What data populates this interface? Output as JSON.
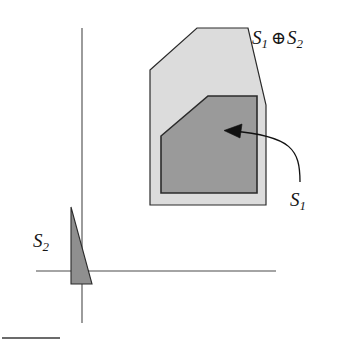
{
  "figure": {
    "caption_free": true,
    "background_color": "#ffffff",
    "labels": {
      "minkowski_sum": {
        "base": "S",
        "sub": "1",
        "operator": "⊕",
        "base2": "S",
        "sub2": "2",
        "full_text": "S1 ⊕ S2"
      },
      "set_s1": {
        "base": "S",
        "sub": "1",
        "full_text": "S1"
      },
      "set_s2": {
        "base": "S",
        "sub": "2",
        "full_text": "S2"
      }
    },
    "colors": {
      "outer_fill": "#dcdcdc",
      "outer_stroke": "#2b2b2b",
      "inner_fill": "#9a9a9a",
      "inner_stroke": "#2b2b2b",
      "triangle_fill": "#8f8f8f",
      "triangle_stroke": "#2b2b2b",
      "axis_stroke": "#4a4a4a",
      "arrow_stroke": "#111111",
      "rule_stroke": "#3a3a3a",
      "text": "#161616"
    }
  },
  "chart_data": {
    "type": "diagram",
    "title": "",
    "xlabel": "",
    "ylabel": "",
    "grid": false,
    "legend": null,
    "axes": {
      "x_axis": {
        "x1": 36,
        "y1": 271,
        "x2": 276,
        "y2": 271
      },
      "y_axis": {
        "x1": 82,
        "y1": 28,
        "x2": 82,
        "y2": 323
      }
    },
    "shapes": [
      {
        "name": "minkowski-sum-polygon",
        "label": "S1 ⊕ S2",
        "fill": "#dcdcdc",
        "stroke": "#2b2b2b",
        "points": "150,70 197,28 248,28 266,105 266,205 150,205"
      },
      {
        "name": "set-s1-polygon",
        "label": "S1",
        "fill": "#9a9a9a",
        "stroke": "#2b2b2b",
        "points": "208,96 257,96 257,193 161,193 161,136"
      },
      {
        "name": "set-s2-triangle",
        "label": "S2",
        "fill": "#8f8f8f",
        "stroke": "#2b2b2b",
        "points": "71,207 92,284 71,284"
      }
    ],
    "annotations": [
      {
        "name": "s1-callout-arrow",
        "from_label": "S1",
        "path": "M 300,182 C 300,150 292,136 232,131",
        "arrow_tip": [
          226,
          131
        ]
      },
      {
        "name": "bottom-rule",
        "path": "M 2,338 L 60,338"
      }
    ]
  }
}
